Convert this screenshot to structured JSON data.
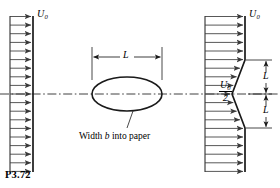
{
  "figure": {
    "number": "P3.72",
    "caption": "Width b into paper",
    "caption_prefix": "Width ",
    "caption_var": "b",
    "caption_suffix": " into paper"
  },
  "labels": {
    "inlet_velocity": "U",
    "inlet_velocity_sub": "0",
    "outlet_velocity": "U",
    "outlet_velocity_sub": "0",
    "centerline_velocity_num": "U",
    "centerline_velocity_num_sub": "0",
    "centerline_velocity_den": "2",
    "body_length": "L",
    "wake_half_height_upper": "L",
    "wake_half_height_lower": "L"
  },
  "colors": {
    "stroke": "#1a1a1a",
    "arrow": "#3a3a3a",
    "background": "#ffffff",
    "centerline": "#2b2b2b"
  },
  "geometry": {
    "canvas_width": 280,
    "canvas_height": 188,
    "centerline_y": 94,
    "inlet_plane_x": 33,
    "outlet_plane_x": 245,
    "wake_min_x": 232,
    "wake_top_y": 60,
    "wake_bottom_y": 128,
    "body_left_x": 92,
    "body_right_x": 162,
    "body_rx": 35,
    "body_ry": 17,
    "dimension_line_y": 57,
    "inlet_arrow_count": 19,
    "outlet_arrow_count": 19
  }
}
